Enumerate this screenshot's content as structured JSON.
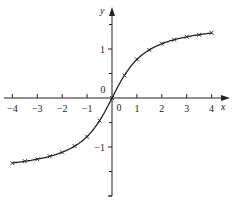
{
  "chart_data": {
    "type": "line",
    "title": "",
    "xlabel": "x",
    "ylabel": "y",
    "xlim": [
      -4,
      4
    ],
    "ylim": [
      -2,
      2
    ],
    "grid": false,
    "legend": null,
    "x_ticks": [
      -4,
      -3,
      -2,
      -1,
      1,
      2,
      3,
      4
    ],
    "x_tick_labels": [
      "-4",
      "-3",
      "-2",
      "-1",
      "1",
      "2",
      "3",
      "4"
    ],
    "y_ticks": [
      -1,
      1
    ],
    "y_tick_labels": [
      "-1",
      "1"
    ],
    "y_minor_ticks": [
      -2,
      -1.5,
      -0.5,
      0.5,
      1.5
    ],
    "origin_labels": [
      "0",
      "0"
    ],
    "series": [
      {
        "name": "curve",
        "style": "smooth-line-with-x-markers",
        "function_hint": "y = arctan(x)",
        "x": [
          -4,
          -3.5,
          -3,
          -2.5,
          -2,
          -1.5,
          -1,
          -0.5,
          0,
          0.5,
          1,
          1.5,
          2,
          2.5,
          3,
          3.5,
          4
        ],
        "values": [
          -1.33,
          -1.29,
          -1.25,
          -1.19,
          -1.11,
          -0.98,
          -0.79,
          -0.46,
          0,
          0.46,
          0.79,
          0.98,
          1.11,
          1.19,
          1.25,
          1.29,
          1.33
        ]
      }
    ]
  },
  "colors": {
    "ink": "#222222",
    "background": "#ffffff"
  }
}
